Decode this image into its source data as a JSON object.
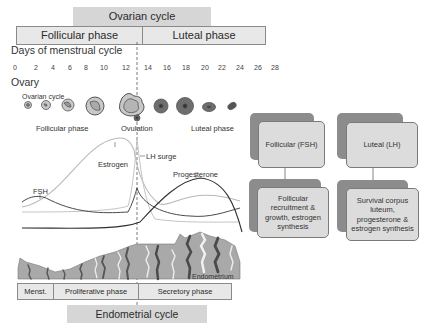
{
  "header": {
    "ovarian_cycle": "Ovarian cycle",
    "follicular_phase": "Follicular phase",
    "luteal_phase": "Luteal phase"
  },
  "days": {
    "title": "Days of menstrual cycle",
    "ticks": [
      "0",
      "2",
      "4",
      "6",
      "8",
      "10",
      "12",
      "14",
      "16",
      "18",
      "20",
      "22",
      "24",
      "26",
      "28"
    ]
  },
  "ovary": {
    "title": "Ovary",
    "ovarian_cycle_label": "Ovarian cycle",
    "follicular_label": "Follicular phase",
    "ovulation_label": "Ovulation",
    "luteal_label": "Luteal phase"
  },
  "hormones": {
    "fsh": "FSH",
    "estrogen": "Estrogen",
    "lh_surge": "LH surge",
    "progesterone": "Progesterone"
  },
  "regulation": {
    "follicular_title": "Follicular (FSH)",
    "luteal_title": "Luteal (LH)",
    "follicular_effect": "Follicular recruitment & growth, estrogen synthesis",
    "luteal_effect": "Survival corpus luteum, progesterone & estrogen synthesis"
  },
  "endometrium": {
    "label": "Endometrium",
    "menst": "Menst.",
    "proliferative": "Proliferative phase",
    "secretory": "Secretory phase",
    "cycle": "Endometrial cycle"
  },
  "colors": {
    "box_fill": "#d6d6d6",
    "card_back": "#8c8c8c",
    "card_front": "#dcdcdc",
    "tissue": "#a9a9a9",
    "gland_dark": "#555555"
  }
}
